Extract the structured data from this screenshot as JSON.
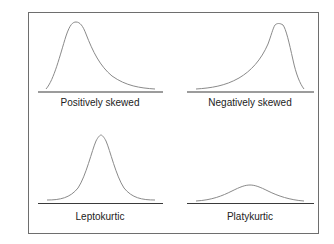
{
  "panels": [
    {
      "id": "positively-skewed",
      "label": "Positively skewed",
      "shape": "right-skewed"
    },
    {
      "id": "negatively-skewed",
      "label": "Negatively skewed",
      "shape": "left-skewed"
    },
    {
      "id": "leptokurtic",
      "label": "Leptokurtic",
      "shape": "tall-narrow-peak"
    },
    {
      "id": "platykurtic",
      "label": "Platykurtic",
      "shape": "low-flat-peak"
    }
  ],
  "colors": {
    "frame": "#6e6e6e",
    "baseline": "#3a3a3a",
    "curve": "#8a8a8a",
    "text": "#222222",
    "background": "#ffffff"
  }
}
